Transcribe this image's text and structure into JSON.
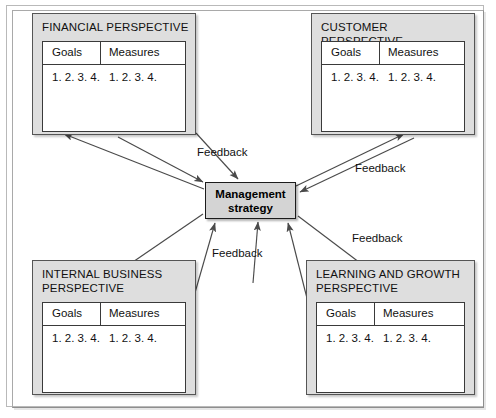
{
  "diagram": {
    "center": {
      "label": "Management\nstrategy",
      "fill": "#d4d4d4",
      "border": "#1b1b1b"
    },
    "panel_fill": "#dedede",
    "panel_border": "#555555",
    "table_fill": "#ffffff",
    "arrow_color": "#4a4a4a",
    "quadrants": [
      {
        "id": "financial",
        "title": "FINANCIAL PERSPECTIVE",
        "columns": [
          "Goals",
          "Measures"
        ],
        "goals": "1.\n2.\n3.\n4.",
        "measures": "1.\n2.\n3.\n4."
      },
      {
        "id": "customer",
        "title": "CUSTOMER PERSPECTIVE",
        "columns": [
          "Goals",
          "Measures"
        ],
        "goals": "1.\n2.\n3.\n4.",
        "measures": "1.\n2.\n3.\n4."
      },
      {
        "id": "internal-business",
        "title": "INTERNAL BUSINESS\nPERSPECTIVE",
        "columns": [
          "Goals",
          "Measures"
        ],
        "goals": "1.\n2.\n3.\n4.",
        "measures": "1.\n2.\n3.\n4."
      },
      {
        "id": "learning-growth",
        "title": "LEARNING AND GROWTH\nPERSPECTIVE",
        "columns": [
          "Goals",
          "Measures"
        ],
        "goals": "1.\n2.\n3.\n4.",
        "measures": "1.\n2.\n3.\n4."
      }
    ],
    "feedback_labels": {
      "top_left": "Feedback",
      "top_right": "Feedback",
      "bottom_right": "Feedback",
      "bottom_left": "Feedback"
    }
  }
}
